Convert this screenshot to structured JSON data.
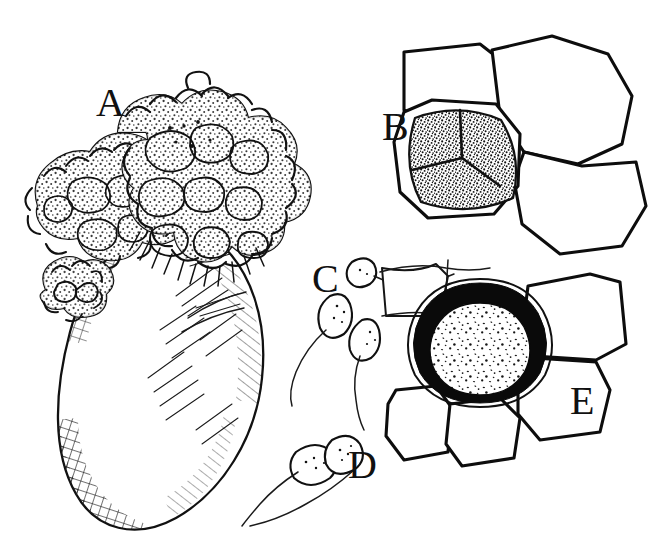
{
  "figure": {
    "medium": "pen-and-ink line drawing",
    "background_color": "#ffffff",
    "ink_color": "#111111",
    "width": 654,
    "height": 555,
    "panel_count": 5
  },
  "labels": {
    "a": "A",
    "b": "B",
    "c": "C",
    "d": "D",
    "e": "E"
  },
  "panels": [
    {
      "key": "a",
      "label": "A",
      "label_x": 96,
      "label_y": 116,
      "subject": "infected host grain with cauliflower-like sporodochial fungal mass at apex",
      "description": "large ovoid host body rendered with cross-hatched shading on the left flank and diagonal hatching on the right, crowned by a dense botryose mass of rounded spore clumps"
    },
    {
      "key": "b",
      "label": "B",
      "label_x": 382,
      "label_y": 140,
      "subject": "epidermal cell containing a quadripartite stippled spore mass",
      "description": "central polygonal cell with a heavily stippled interior divided into four lobes, adjoined by three clear polygonal host cells"
    },
    {
      "key": "c",
      "label": "C",
      "label_x": 312,
      "label_y": 292,
      "subject": "three stalked conidia on slender hyphae",
      "description": "elongate tapering stalks each terminating in a small ovoid, lightly dotted spore"
    },
    {
      "key": "d",
      "label": "D",
      "label_x": 348,
      "label_y": 478,
      "subject": "germinating two-celled conidium on a stalk",
      "description": "stalked structure bearing a larger basal cell and a smaller rounded terminal cell, both finely dotted"
    },
    {
      "key": "e",
      "label": "E",
      "label_x": 570,
      "label_y": 414,
      "subject": "mature thick-walled melanized resting spore within host tissue",
      "description": "rounded spore with a heavy solid black wall enclosing a pale sparsely speckled lumen, set among thin-walled polygonal host cells"
    }
  ]
}
